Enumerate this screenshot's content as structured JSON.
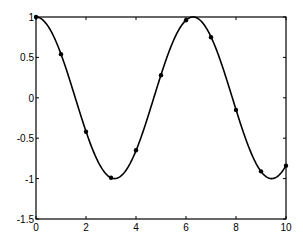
{
  "chart_data": {
    "type": "line",
    "title": "",
    "xlabel": "",
    "ylabel": "",
    "xlim": [
      0,
      10
    ],
    "ylim": [
      -1.5,
      1
    ],
    "grid": false,
    "legend": null,
    "x_ticks": [
      "0",
      "2",
      "4",
      "6",
      "8",
      "10"
    ],
    "y_ticks": [
      "-1.5",
      "-1",
      "-0.5",
      "0",
      "0.5",
      "1"
    ],
    "series": [
      {
        "name": "samples",
        "style": "markers",
        "x": [
          0,
          1,
          2,
          3,
          4,
          5,
          6,
          7,
          8,
          9,
          10
        ],
        "values": [
          1.0,
          0.54,
          -0.42,
          -0.99,
          -0.65,
          0.28,
          0.96,
          0.75,
          -0.15,
          -0.91,
          -0.84
        ]
      },
      {
        "name": "interpolant",
        "style": "smooth-line",
        "function": "cos(x)",
        "x_range": [
          0,
          10
        ]
      }
    ],
    "colors": {
      "line": "#000000",
      "markers": "#000000",
      "background": "#ffffff"
    }
  }
}
